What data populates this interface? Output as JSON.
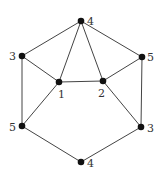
{
  "graph": {
    "nodes": [
      {
        "id": "top",
        "label": "4",
        "x": 81,
        "y": 21,
        "lx": 87,
        "ly": 25
      },
      {
        "id": "left-upper",
        "label": "3",
        "x": 22,
        "y": 56,
        "lx": 9,
        "ly": 60
      },
      {
        "id": "right-upper",
        "label": "5",
        "x": 142,
        "y": 57,
        "lx": 147,
        "ly": 61
      },
      {
        "id": "center-left",
        "label": "1",
        "x": 59,
        "y": 82,
        "lx": 58,
        "ly": 98
      },
      {
        "id": "center-right",
        "label": "2",
        "x": 103,
        "y": 81,
        "lx": 98,
        "ly": 97
      },
      {
        "id": "left-lower",
        "label": "5",
        "x": 22,
        "y": 126,
        "lx": 9,
        "ly": 131
      },
      {
        "id": "right-lower",
        "label": "3",
        "x": 141,
        "y": 127,
        "lx": 147,
        "ly": 132
      },
      {
        "id": "bottom",
        "label": "4",
        "x": 81,
        "y": 162,
        "lx": 87,
        "ly": 167
      }
    ],
    "edges": [
      [
        "top",
        "left-upper"
      ],
      [
        "top",
        "right-upper"
      ],
      [
        "top",
        "center-left"
      ],
      [
        "top",
        "center-right"
      ],
      [
        "left-upper",
        "center-left"
      ],
      [
        "left-upper",
        "left-lower"
      ],
      [
        "right-upper",
        "center-right"
      ],
      [
        "right-upper",
        "right-lower"
      ],
      [
        "center-left",
        "center-right"
      ],
      [
        "center-left",
        "left-lower"
      ],
      [
        "center-right",
        "right-lower"
      ],
      [
        "left-lower",
        "bottom"
      ],
      [
        "right-lower",
        "bottom"
      ]
    ]
  }
}
